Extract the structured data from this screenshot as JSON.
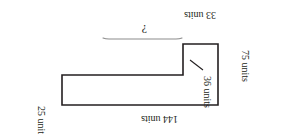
{
  "diagram": {
    "type": "dimensioned-polygon",
    "orientation_note": "figure rendered rotated 180 degrees",
    "labels": {
      "top": "33 units",
      "left": "75 units",
      "bottom": "144 units",
      "step_right": "36 units",
      "right": "25 units",
      "unknown": "?"
    },
    "colors": {
      "stroke": "#231f20",
      "text": "#231f20",
      "brace": "#6f6f6f",
      "background": "#ffffff"
    },
    "measurements": [
      {
        "name": "top-edge",
        "value": "33 units"
      },
      {
        "name": "left-edge",
        "value": "75 units"
      },
      {
        "name": "bottom-edge",
        "value": "144 units"
      },
      {
        "name": "step-right-edge",
        "value": "36 units"
      },
      {
        "name": "right-edge",
        "value": "25 units"
      },
      {
        "name": "middle-horizontal-edge",
        "value": "?"
      }
    ]
  }
}
